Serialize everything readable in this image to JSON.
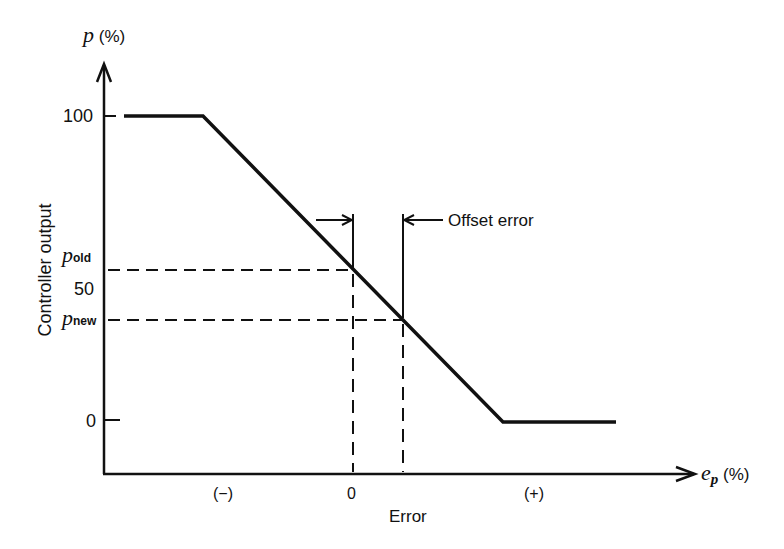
{
  "diagram": {
    "y_axis": {
      "symbol": "p",
      "unit": "(%)",
      "label": "Controller output",
      "ticks": [
        {
          "label": "100",
          "value": 100
        },
        {
          "label": "50",
          "value": 50
        },
        {
          "label": "0",
          "value": 0
        }
      ],
      "markers": [
        {
          "symbol": "p",
          "subscript": "old"
        },
        {
          "symbol": "p",
          "subscript": "new"
        }
      ]
    },
    "x_axis": {
      "symbol": "e",
      "subscript": "p",
      "unit": "(%)",
      "label": "Error",
      "ticks": [
        {
          "label": "(−)"
        },
        {
          "label": "0"
        },
        {
          "label": "(+)"
        }
      ]
    },
    "annotation": {
      "offset_label": "Offset error"
    },
    "curve": {
      "description": "Proportional controller characteristic: saturates at 100% for large negative error, linear decrease through band, saturates at 0% for large positive error",
      "color": "#111111"
    }
  }
}
